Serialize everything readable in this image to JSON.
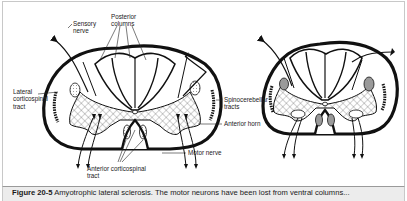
{
  "figure": {
    "caption_label": "Figure 20-5",
    "caption_text": " Amyotrophic lateral sclerosis. The motor neurons have been lost from ventral columns..."
  },
  "labels": {
    "sensory_nerve": "Sensory\nnerve",
    "posterior_columns": "Posterior\ncolumns",
    "lateral_corticospinal_tract": "Lateral\ncorticospinal\ntract",
    "spinocerebellar_tracts": "Spinocerebellar\ntracts",
    "anterior_horn": "Anterior horn",
    "motor_nerve": "Motor nerve",
    "anterior_corticospinal_tract": "Anterior corticospinal\ntract"
  },
  "panels": [
    {
      "name": "normal-spinal-cord",
      "description": "Normal spinal cord cross-section"
    },
    {
      "name": "als-spinal-cord",
      "description": "Spinal cord cross-section in ALS with degenerated (shaded) corticospinal tracts and lost anterior horn neurons"
    }
  ],
  "colors": {
    "line": "#111111",
    "caption_band": "#ececec",
    "tract_shaded": "#9a9a9a"
  }
}
